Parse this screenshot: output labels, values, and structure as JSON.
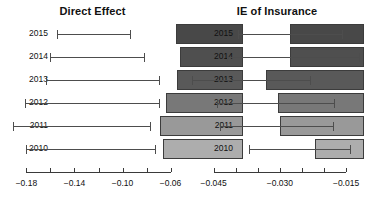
{
  "chart_data": [
    {
      "type": "bar",
      "orientation": "horizontal",
      "title": "Direct Effect",
      "xlabel": "",
      "ylabel": "",
      "categories": [
        "2015",
        "2014",
        "2013",
        "2012",
        "2011",
        "2010"
      ],
      "values": [
        -0.0555,
        -0.0525,
        -0.0545,
        -0.064,
        -0.069,
        -0.0665
      ],
      "bar_start": 0.0,
      "error_low": [
        -0.1545,
        -0.1605,
        -0.1635,
        -0.1815,
        -0.1915,
        -0.1805
      ],
      "error_high": [
        -0.094,
        -0.082,
        -0.07,
        -0.07,
        -0.077,
        -0.073
      ],
      "xlim": [
        -0.202,
        -0.048
      ],
      "tick_values": [
        -0.18,
        -0.16,
        -0.14,
        -0.12,
        -0.1,
        -0.08,
        -0.06
      ],
      "tick_labels": [
        "−0.18",
        "",
        "−0.14",
        "",
        "−0.10",
        "",
        "−0.06"
      ],
      "grid": false,
      "legend": "none",
      "bar_colors": [
        "#484848",
        "#4f4f4f",
        "#595959",
        "#787878",
        "#999999",
        "#adadad"
      ],
      "bar_border_color": "#3c3c3c",
      "error_color": "#4d4d4d"
    },
    {
      "type": "bar",
      "orientation": "horizontal",
      "title": "IE of Insurance",
      "xlabel": "",
      "ylabel": "",
      "categories": [
        "2015",
        "2014",
        "2013",
        "2012",
        "2011",
        "2010"
      ],
      "values": [
        -0.0278,
        -0.0278,
        -0.0332,
        -0.0305,
        -0.03,
        -0.022
      ],
      "bar_start": -0.011,
      "error_low": [
        -0.0395,
        -0.042,
        -0.05,
        -0.0443,
        -0.0435,
        -0.037
      ],
      "error_high": [
        -0.016,
        -0.012,
        -0.0232,
        -0.0178,
        -0.018,
        -0.014
      ],
      "xlim": [
        -0.0515,
        -0.0098
      ],
      "tick_values": [
        -0.045,
        -0.04,
        -0.035,
        -0.03,
        -0.025,
        -0.02,
        -0.015
      ],
      "tick_labels": [
        "−0.045",
        "",
        "",
        "−0.030",
        "",
        "",
        "−0.015"
      ],
      "grid": false,
      "legend": "none",
      "bar_colors": [
        "#484848",
        "#4f4f4f",
        "#595959",
        "#787878",
        "#999999",
        "#adadad"
      ],
      "bar_border_color": "#3c3c3c",
      "error_color": "#4d4d4d"
    }
  ],
  "panels": {
    "left": {
      "title": "Direct Effect",
      "category_labels": [
        "2015",
        "2014",
        "2013",
        "2012",
        "2011",
        "2010"
      ],
      "tick_labels": [
        "−0.18",
        "−0.14",
        "−0.10",
        "−0.06"
      ]
    },
    "right": {
      "title": "IE of Insurance",
      "category_labels": [
        "2015",
        "2014",
        "2013",
        "2012",
        "2011",
        "2010"
      ],
      "tick_labels": [
        "−0.045",
        "−0.030",
        "−0.015"
      ]
    }
  },
  "colors": {
    "background": "#ffffff",
    "text": "#111111",
    "axis": "#3a3a3a",
    "error": "#4d4d4d",
    "bar_darkest": "#484848",
    "bar_lightest": "#adadad"
  }
}
